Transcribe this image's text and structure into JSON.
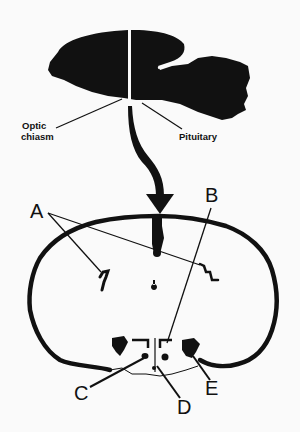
{
  "figure": {
    "type": "anatomical-schematic",
    "top_panel": {
      "subject": "sagittal brain silhouette",
      "labels": {
        "optic_chiasm_line1": "Optic",
        "optic_chiasm_line2": "chiasm",
        "pituitary": "Pituitary"
      }
    },
    "connector": "curved arrow pointing down to coronal section",
    "bottom_panel": {
      "subject": "coronal brain section",
      "letters": {
        "a": "A",
        "b": "B",
        "c": "C",
        "d": "D",
        "e": "E"
      }
    },
    "colors": {
      "ink": "#111111",
      "background": "#fafafa"
    }
  }
}
